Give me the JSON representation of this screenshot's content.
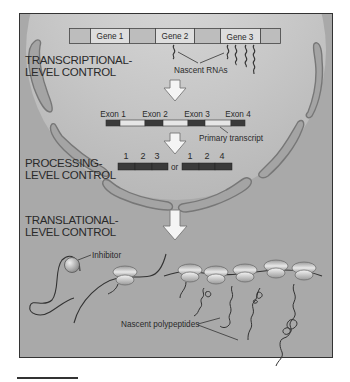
{
  "figure": {
    "control_levels": [
      {
        "id": "transcriptional",
        "line1": "TRANSCRIPTIONAL-",
        "line2": "LEVEL CONTROL"
      },
      {
        "id": "processing",
        "line1": "PROCESSING-",
        "line2": "LEVEL CONTROL"
      },
      {
        "id": "translational",
        "line1": "TRANSLATIONAL-",
        "line2": "LEVEL CONTROL"
      }
    ],
    "genes": [
      "Gene 1",
      "Gene 2",
      "Gene 3"
    ],
    "nascent_rnas_label": "Nascent RNAs",
    "exons": [
      "Exon 1",
      "Exon 2",
      "Exon 3",
      "Exon 4"
    ],
    "primary_transcript_label": "Primary transcript",
    "spliced_options": {
      "option_a": [
        "1",
        "2",
        "3"
      ],
      "separator": "or",
      "option_b": [
        "1",
        "2",
        "4"
      ]
    },
    "inhibitor_label": "Inhibitor",
    "nascent_polypeptides_label": "Nascent polypeptides"
  },
  "colors": {
    "background": "#a9a9a9",
    "nucleus": "#c9c9c9",
    "membrane_fill": "#a4a4a4",
    "membrane_stroke": "#777777",
    "gene_box": "#d9d9d9",
    "exon_dark": "#3a3a3a",
    "intron_light": "#e4e4e4",
    "arrow_fill": "#f2f2f2",
    "ribosome": "#d0d0d0",
    "line": "#3a3a3a"
  }
}
